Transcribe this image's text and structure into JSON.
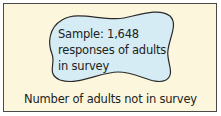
{
  "diagram": {
    "population": {
      "label": "Number of adults not in survey",
      "fill": "#fcf7dc",
      "border": "#4a4a4a"
    },
    "sample": {
      "lines": [
        "Sample: 1,648",
        "responses of adults",
        "in survey"
      ],
      "fill": "#d5ecf4",
      "outline": "#2a2a2a"
    }
  }
}
